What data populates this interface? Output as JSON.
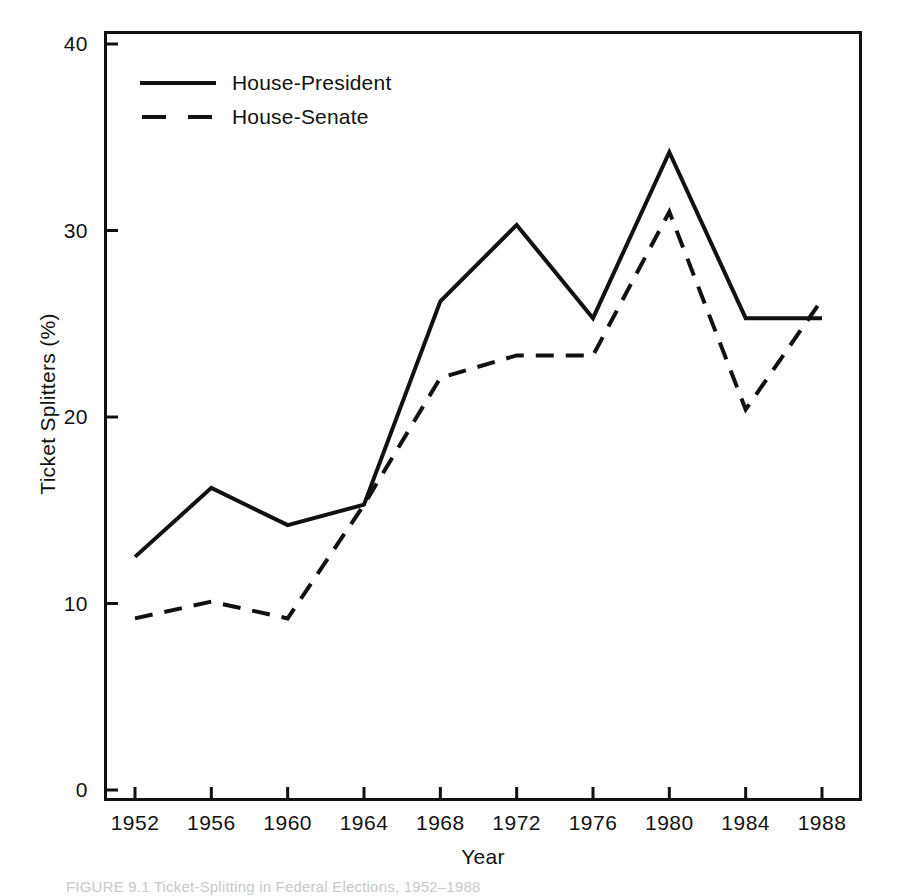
{
  "figure": {
    "caption": "FIGURE 9.1  Ticket-Splitting in Federal Elections, 1952–1988"
  },
  "chart_data": {
    "type": "line",
    "title": "",
    "xlabel": "Year",
    "ylabel": "Ticket Splitters (%)",
    "xlim": [
      1950,
      1990
    ],
    "ylim": [
      0,
      40
    ],
    "yticks": [
      0,
      10,
      20,
      30,
      40
    ],
    "ytick_labels": [
      "0",
      "10",
      "20",
      "30",
      "40"
    ],
    "xticks": [
      1952,
      1956,
      1960,
      1964,
      1968,
      1972,
      1976,
      1980,
      1984,
      1988
    ],
    "xtick_labels": [
      "1952",
      "1956",
      "1960",
      "1964",
      "1968",
      "1972",
      "1976",
      "1980",
      "1984",
      "1988"
    ],
    "x": [
      1952,
      1956,
      1960,
      1964,
      1968,
      1972,
      1976,
      1980,
      1984,
      1988
    ],
    "grid": false,
    "legend_position": "top-left",
    "series": [
      {
        "name": "House-President",
        "style": "solid",
        "color": "#111111",
        "values": [
          12.5,
          16.2,
          14.2,
          15.3,
          26.2,
          30.3,
          25.3,
          34.2,
          25.3,
          25.3
        ]
      },
      {
        "name": "House-Senate",
        "style": "dashed",
        "color": "#111111",
        "values": [
          9.2,
          10.1,
          9.2,
          15.3,
          22.1,
          23.3,
          23.3,
          31.0,
          20.4,
          26.3
        ]
      }
    ]
  },
  "legend": {
    "items": [
      {
        "label": "House-President",
        "style": "solid"
      },
      {
        "label": "House-Senate",
        "style": "dashed"
      }
    ]
  }
}
